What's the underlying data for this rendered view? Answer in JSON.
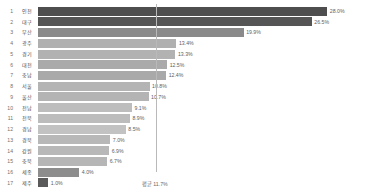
{
  "chart_data": {
    "type": "bar",
    "title": "",
    "xlabel": "",
    "ylabel": "",
    "orientation": "horizontal",
    "grid": false,
    "legend": null,
    "xlim": [
      0,
      30
    ],
    "value_suffix": "%",
    "average": {
      "label": "평균 11.7%",
      "value": 11.7
    },
    "categories": [
      "인천",
      "대구",
      "부산",
      "광주",
      "경기",
      "대전",
      "충남",
      "서울",
      "울산",
      "전남",
      "전북",
      "경남",
      "경북",
      "강원",
      "충북",
      "세종",
      "제주"
    ],
    "values": [
      28.0,
      26.5,
      19.9,
      13.4,
      13.3,
      12.5,
      12.4,
      10.8,
      10.7,
      9.1,
      8.9,
      8.5,
      7.0,
      6.9,
      6.7,
      4.0,
      1.0
    ],
    "rows": [
      {
        "rank": "1",
        "region": "인천",
        "value": 28.0,
        "value_label": "28.0%",
        "color": "#4e4e4e"
      },
      {
        "rank": "2",
        "region": "대구",
        "value": 26.5,
        "value_label": "26.5%",
        "color": "#555555"
      },
      {
        "rank": "3",
        "region": "부산",
        "value": 19.9,
        "value_label": "19.9%",
        "color": "#8a8a8a"
      },
      {
        "rank": "4",
        "region": "광주",
        "value": 13.4,
        "value_label": "13.4%",
        "color": "#b0b0b0"
      },
      {
        "rank": "5",
        "region": "경기",
        "value": 13.3,
        "value_label": "13.3%",
        "color": "#b2b2b2"
      },
      {
        "rank": "6",
        "region": "대전",
        "value": 12.5,
        "value_label": "12.5%",
        "color": "#aaaaaa"
      },
      {
        "rank": "7",
        "region": "충남",
        "value": 12.4,
        "value_label": "12.4%",
        "color": "#a9a9a9"
      },
      {
        "rank": "8",
        "region": "서울",
        "value": 10.8,
        "value_label": "10.8%",
        "color": "#b4b4b4"
      },
      {
        "rank": "9",
        "region": "울산",
        "value": 10.7,
        "value_label": "10.7%",
        "color": "#b4b4b4"
      },
      {
        "rank": "10",
        "region": "전남",
        "value": 9.1,
        "value_label": "9.1%",
        "color": "#bdbdbd"
      },
      {
        "rank": "11",
        "region": "전북",
        "value": 8.9,
        "value_label": "8.9%",
        "color": "#bcbcbc"
      },
      {
        "rank": "12",
        "region": "경남",
        "value": 8.5,
        "value_label": "8.5%",
        "color": "#c2c2c2"
      },
      {
        "rank": "13",
        "region": "경북",
        "value": 7.0,
        "value_label": "7.0%",
        "color": "#b8b8b8"
      },
      {
        "rank": "14",
        "region": "강원",
        "value": 6.9,
        "value_label": "6.9%",
        "color": "#b8b8b8"
      },
      {
        "rank": "15",
        "region": "충북",
        "value": 6.7,
        "value_label": "6.7%",
        "color": "#b6b6b6"
      },
      {
        "rank": "16",
        "region": "세종",
        "value": 4.0,
        "value_label": "4.0%",
        "color": "#8d8d8d"
      },
      {
        "rank": "17",
        "region": "제주",
        "value": 1.0,
        "value_label": "1.0%",
        "color": "#5a5a5a"
      }
    ]
  }
}
